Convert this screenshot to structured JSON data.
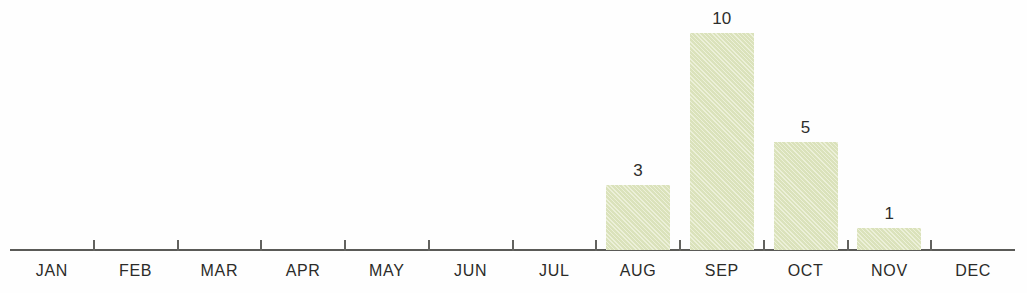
{
  "chart_data": {
    "type": "bar",
    "title": "",
    "subtitle": "",
    "xlabel": "",
    "ylabel": "",
    "categories": [
      "JAN",
      "FEB",
      "MAR",
      "APR",
      "MAY",
      "JUN",
      "JUL",
      "AUG",
      "SEP",
      "OCT",
      "NOV",
      "DEC"
    ],
    "values": [
      0,
      0,
      0,
      0,
      0,
      0,
      0,
      3,
      10,
      5,
      1,
      0
    ],
    "value_labels": [
      "",
      "",
      "",
      "",
      "",
      "",
      "",
      "3",
      "10",
      "5",
      "1",
      ""
    ],
    "ylim": [
      0,
      10
    ],
    "grid": false,
    "legend": null,
    "bar_color": "#e2e8c4",
    "axis_color": "#5a5a57",
    "label_color": "#2b2b29",
    "background": "#ffffff"
  },
  "axis": {
    "tick_count": 11,
    "baseline_y": 250
  }
}
